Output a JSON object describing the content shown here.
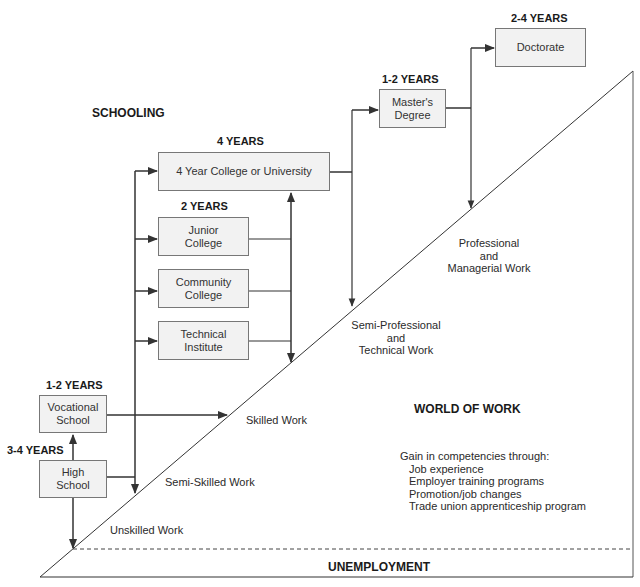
{
  "diagram": {
    "title_schooling": "SCHOOLING",
    "title_world_of_work": "WORLD OF WORK",
    "unemployment_label": "UNEMPLOYMENT",
    "colors": {
      "box_fill": "#f2f2f2",
      "box_border": "#777777",
      "line": "#333333",
      "text": "#222222"
    },
    "schooling_nodes": [
      {
        "id": "high-school",
        "label": "High\nSchool",
        "duration": "3-4 YEARS"
      },
      {
        "id": "vocational-school",
        "label": "Vocational\nSchool",
        "duration": "1-2 YEARS"
      },
      {
        "id": "junior-college",
        "label": "Junior\nCollege",
        "duration": "2 YEARS"
      },
      {
        "id": "community-college",
        "label": "Community\nCollege",
        "duration": ""
      },
      {
        "id": "technical-institute",
        "label": "Technical\nInstitute",
        "duration": ""
      },
      {
        "id": "college-university",
        "label": "4 Year College or University",
        "duration": "4 YEARS"
      },
      {
        "id": "masters-degree",
        "label": "Master's\nDegree",
        "duration": "1-2 YEARS"
      },
      {
        "id": "doctorate",
        "label": "Doctorate",
        "duration": "2-4 YEARS"
      }
    ],
    "work_levels": [
      {
        "id": "unskilled",
        "label": "Unskilled Work"
      },
      {
        "id": "semi-skilled",
        "label": "Semi-Skilled Work"
      },
      {
        "id": "skilled",
        "label": "Skilled Work"
      },
      {
        "id": "semi-professional",
        "label": "Semi-Professional\nand\nTechnical Work"
      },
      {
        "id": "professional",
        "label": "Professional\nand\nManagerial Work"
      }
    ],
    "competencies": {
      "heading": "Gain in competencies through:",
      "items": [
        "Job experience",
        "Employer training programs",
        "Promotion/job changes",
        "Trade union apprenticeship program"
      ]
    },
    "edges": [
      {
        "from": "high-school",
        "to": "vocational-school"
      },
      {
        "from": "high-school",
        "to": "unskilled"
      },
      {
        "from": "high-school",
        "to": "semi-skilled"
      },
      {
        "from": "high-school",
        "to": "college-university"
      },
      {
        "from": "high-school",
        "to": "junior-college"
      },
      {
        "from": "high-school",
        "to": "community-college"
      },
      {
        "from": "high-school",
        "to": "technical-institute"
      },
      {
        "from": "vocational-school",
        "to": "skilled"
      },
      {
        "from": "junior-college",
        "to": "college-university"
      },
      {
        "from": "community-college",
        "to": "college-university"
      },
      {
        "from": "technical-institute",
        "to": "college-university"
      },
      {
        "from": "two-year-programs",
        "to": "semi-professional"
      },
      {
        "from": "college-university",
        "to": "masters-degree"
      },
      {
        "from": "college-university",
        "to": "semi-professional"
      },
      {
        "from": "masters-degree",
        "to": "doctorate"
      },
      {
        "from": "masters-degree",
        "to": "professional"
      }
    ]
  }
}
